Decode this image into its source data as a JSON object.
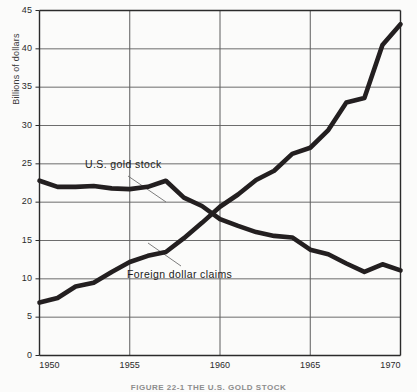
{
  "figure": {
    "caption": "FIGURE 22-1    THE U.S. GOLD STOCK"
  },
  "axes": {
    "ylabel": "Billions of dollars",
    "yticks": [
      "0",
      "5",
      "10",
      "15",
      "20",
      "25",
      "30",
      "35",
      "40",
      "45"
    ],
    "xticks": [
      "1950",
      "1955",
      "1960",
      "1965",
      "1970"
    ]
  },
  "annotations": {
    "gold_label": "U.S. gold stock",
    "claims_label": "Foreign dollar claims"
  },
  "colors": {
    "line": "#231f20",
    "grid": "#5c5c5c",
    "frame": "#2b2b2b",
    "background": "#fbfbfa",
    "leader": "#6e6e6e"
  },
  "chart_data": {
    "type": "line",
    "title": "FIGURE 22-1    THE U.S. GOLD STOCK",
    "xlabel": "",
    "ylabel": "Billions of dollars",
    "xlim": [
      1950,
      1970
    ],
    "ylim": [
      0,
      45
    ],
    "xticks": [
      1950,
      1955,
      1960,
      1965,
      1970
    ],
    "yticks": [
      0,
      5,
      10,
      15,
      20,
      25,
      30,
      35,
      40,
      45
    ],
    "grid": true,
    "legend": "inline-annotations",
    "x": [
      1950,
      1951,
      1952,
      1953,
      1954,
      1955,
      1956,
      1957,
      1958,
      1959,
      1960,
      1961,
      1962,
      1963,
      1964,
      1965,
      1966,
      1967,
      1968,
      1969,
      1970
    ],
    "series": [
      {
        "name": "U.S. gold stock",
        "values": [
          22.8,
          22.0,
          22.0,
          22.1,
          21.8,
          21.7,
          22.0,
          22.8,
          20.6,
          19.5,
          17.8,
          16.9,
          16.1,
          15.6,
          15.4,
          13.8,
          13.2,
          12.0,
          10.9,
          11.9,
          11.1
        ]
      },
      {
        "name": "Foreign dollar claims",
        "values": [
          6.9,
          7.5,
          9.0,
          9.5,
          10.9,
          12.2,
          13.0,
          13.5,
          15.3,
          17.3,
          19.4,
          21.0,
          22.9,
          24.1,
          26.3,
          27.1,
          29.4,
          33.0,
          33.6,
          40.5,
          43.2
        ]
      }
    ],
    "annotations": [
      {
        "text": "U.S. gold stock",
        "x": 1952.6,
        "y": 25.2
      },
      {
        "text": "Foreign dollar claims",
        "x": 1954.7,
        "y": 11.7
      }
    ]
  }
}
